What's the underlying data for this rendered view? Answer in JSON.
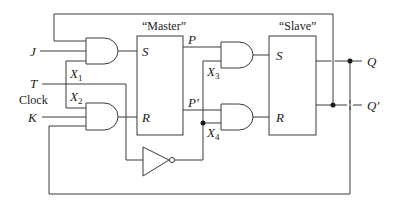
{
  "diagram": {
    "type": "JK master-slave flip-flop logic diagram",
    "blocks": {
      "master": {
        "title": "“Master”",
        "inputs": [
          "S",
          "R"
        ],
        "outputs": [
          "P",
          "P′"
        ]
      },
      "slave": {
        "title": "“Slave”",
        "inputs": [
          "S",
          "R"
        ]
      }
    },
    "inputs": {
      "j": "J",
      "t": "T",
      "clock": "Clock",
      "k": "K"
    },
    "outputs": {
      "q": "Q",
      "q_prime": "Q′"
    },
    "nodes": {
      "x1": {
        "base": "X",
        "sub": "1"
      },
      "x2": {
        "base": "X",
        "sub": "2"
      },
      "x3": {
        "base": "X",
        "sub": "3"
      },
      "x4": {
        "base": "X",
        "sub": "4"
      }
    },
    "pin_labels": {
      "master_s": "S",
      "master_r": "R",
      "master_p": "P",
      "master_p_prime": "P′",
      "slave_s": "S",
      "slave_r": "R"
    },
    "gates": [
      "AND (J)",
      "AND (K)",
      "AND (X3)",
      "AND (X4)",
      "NOT (clock inverter)"
    ],
    "colors": {
      "line": "#3a3a3a",
      "junction": "#1a1a1a",
      "background": "#ffffff"
    }
  }
}
